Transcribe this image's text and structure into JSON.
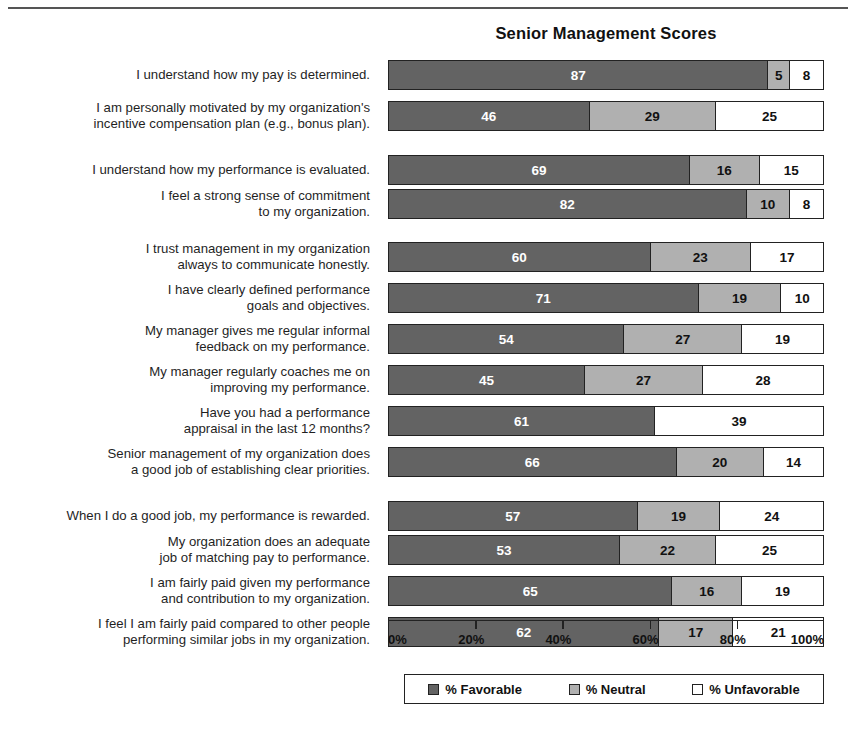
{
  "chart_data": {
    "type": "bar",
    "subtype": "stacked-horizontal-100pct",
    "title": "Senior Management Scores",
    "xlabel": "",
    "ylabel": "",
    "xlim": [
      0,
      100
    ],
    "xtick_labels": [
      "0%",
      "20%",
      "40%",
      "60%",
      "80%",
      "100%"
    ],
    "xticks": [
      0,
      20,
      40,
      60,
      80,
      100
    ],
    "grid": false,
    "legend_position": "bottom",
    "legend": [
      "% Favorable",
      "% Neutral",
      "% Unfavorable"
    ],
    "series": [
      {
        "name": "% Favorable",
        "color": "#636363",
        "values": [
          87,
          46,
          69,
          82,
          60,
          71,
          54,
          45,
          61,
          66,
          57,
          53,
          65,
          62
        ]
      },
      {
        "name": "% Neutral",
        "color": "#b0b0b0",
        "values": [
          5,
          29,
          16,
          10,
          23,
          19,
          27,
          27,
          0,
          20,
          19,
          22,
          16,
          17
        ]
      },
      {
        "name": "% Unfavorable",
        "color": "#ffffff",
        "values": [
          8,
          25,
          15,
          8,
          17,
          10,
          19,
          28,
          39,
          14,
          24,
          25,
          19,
          21
        ]
      }
    ],
    "categories": [
      "I understand how my pay is determined.",
      "I am personally motivated by my organization's incentive compensation plan (e.g., bonus plan).",
      "I understand how my performance is evaluated.",
      "I feel a strong sense of commitment to my organization.",
      "I trust management in my organization always to communicate honestly.",
      "I have clearly defined performance goals and objectives.",
      "My manager gives me regular informal feedback on my performance.",
      "My manager regularly coaches me on improving my performance.",
      "Have you had a performance appraisal in the last 12 months?",
      "Senior management of my organization does a good job of establishing clear priorities.",
      "When I do a good job, my performance is rewarded.",
      "My organization does an adequate job of matching pay to performance.",
      "I am fairly paid given my performance and contribution to my organization.",
      "I feel I am fairly paid compared to other people performing similar jobs in my organization."
    ],
    "category_lines": [
      [
        "I understand how my pay is determined."
      ],
      [
        "I am personally motivated by my organization's",
        "incentive compensation plan (e.g., bonus plan)."
      ],
      [
        "I understand how my performance is evaluated."
      ],
      [
        "I feel a strong sense of commitment",
        "to my organization."
      ],
      [
        "I trust management in my organization",
        "always to communicate honestly."
      ],
      [
        "I have clearly defined performance",
        "goals and objectives."
      ],
      [
        "My manager gives me regular informal",
        "feedback on my performance."
      ],
      [
        "My manager regularly coaches me on",
        "improving my performance."
      ],
      [
        "Have you had a performance",
        "appraisal in the last 12 months?"
      ],
      [
        "Senior management of my organization does",
        "a good job of establishing clear priorities."
      ],
      [
        "When I do a good job, my performance is rewarded."
      ],
      [
        "My organization does an adequate",
        "job of matching pay to performance."
      ],
      [
        "I am fairly paid given my performance",
        "and contribution to my organization."
      ],
      [
        "I feel I am fairly paid compared to other people",
        "performing similar jobs in my organization."
      ]
    ]
  },
  "legend": {
    "items": [
      {
        "label": "% Favorable",
        "swatch": "dark-gray-swatch-icon"
      },
      {
        "label": "% Neutral",
        "swatch": "light-gray-swatch-icon"
      },
      {
        "label": "% Unfavorable",
        "swatch": "white-swatch-icon"
      }
    ]
  },
  "colors": {
    "favorable": "#636363",
    "neutral": "#b0b0b0",
    "unfavorable": "#ffffff",
    "outline": "#222222",
    "rule": "#555555"
  }
}
